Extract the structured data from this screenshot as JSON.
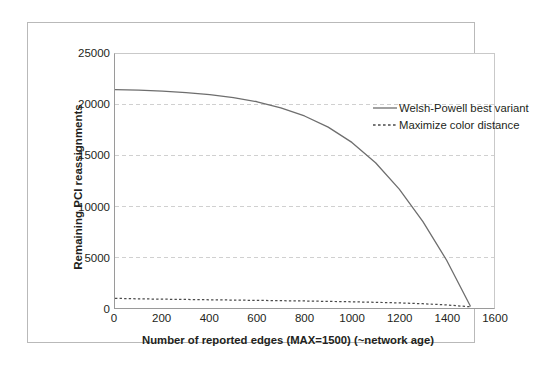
{
  "chart_data": {
    "type": "line",
    "title": "",
    "xlabel": "Number of reported edges (MAX=1500) (~network age)",
    "ylabel": "Remaining PCI reassignments",
    "xlim": [
      0,
      1600
    ],
    "ylim": [
      0,
      25000
    ],
    "xticks": [
      0,
      200,
      400,
      600,
      800,
      1000,
      1200,
      1400,
      1600
    ],
    "yticks": [
      0,
      5000,
      10000,
      15000,
      20000,
      25000
    ],
    "xtick_labels": [
      "0",
      "200",
      "400",
      "600",
      "800",
      "1000",
      "1200",
      "1400",
      "1600"
    ],
    "ytick_labels": [
      "0",
      "5000",
      "10000",
      "15000",
      "20000",
      "25000"
    ],
    "grid": "horizontal-dashed",
    "legend_position": "top-right-inside",
    "series": [
      {
        "name": "Welsh-Powell best variant",
        "style": "solid",
        "color": "#6e6e6e",
        "x": [
          0,
          100,
          200,
          300,
          400,
          500,
          600,
          700,
          800,
          900,
          1000,
          1100,
          1200,
          1300,
          1400,
          1500
        ],
        "values": [
          21500,
          21450,
          21350,
          21200,
          21000,
          20700,
          20300,
          19700,
          18900,
          17800,
          16300,
          14300,
          11700,
          8500,
          4700,
          200
        ]
      },
      {
        "name": "Maximize color distance",
        "style": "dashed",
        "color": "#4a4a4a",
        "x": [
          0,
          100,
          200,
          300,
          400,
          500,
          600,
          700,
          800,
          900,
          1000,
          1100,
          1200,
          1300,
          1400,
          1500
        ],
        "values": [
          950,
          900,
          870,
          840,
          810,
          780,
          750,
          720,
          690,
          650,
          610,
          560,
          500,
          420,
          300,
          120
        ]
      }
    ]
  }
}
